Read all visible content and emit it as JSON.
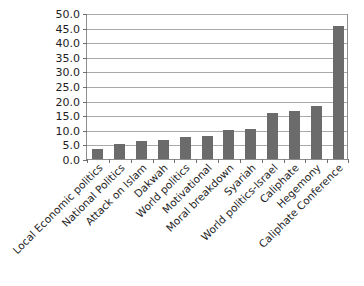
{
  "chart_data": {
    "type": "bar",
    "title": "",
    "xlabel": "",
    "ylabel": "",
    "ylim": [
      0,
      50
    ],
    "ytick_step": 5,
    "ytick_labels": [
      "0.0",
      "5.0",
      "10.0",
      "15.0",
      "20.0",
      "25.0",
      "30.0",
      "35.0",
      "40.0",
      "45.0",
      "50.0"
    ],
    "grid": "horizontal",
    "legend": "none",
    "bar_color": "#6b6b6b",
    "categories": [
      "Local Economic politics",
      "National Politics",
      "Attack on Islam",
      "Dakwah",
      "World politics",
      "Motivational",
      "Moral breakdown",
      "Syariah",
      "World politics-Israel",
      "Caliphate",
      "Hegemony",
      "Caliphate Conference"
    ],
    "values": [
      3.4,
      5.2,
      6.0,
      6.5,
      7.6,
      7.8,
      9.9,
      10.4,
      15.6,
      16.4,
      18.1,
      45.4
    ]
  },
  "partial_title": ""
}
